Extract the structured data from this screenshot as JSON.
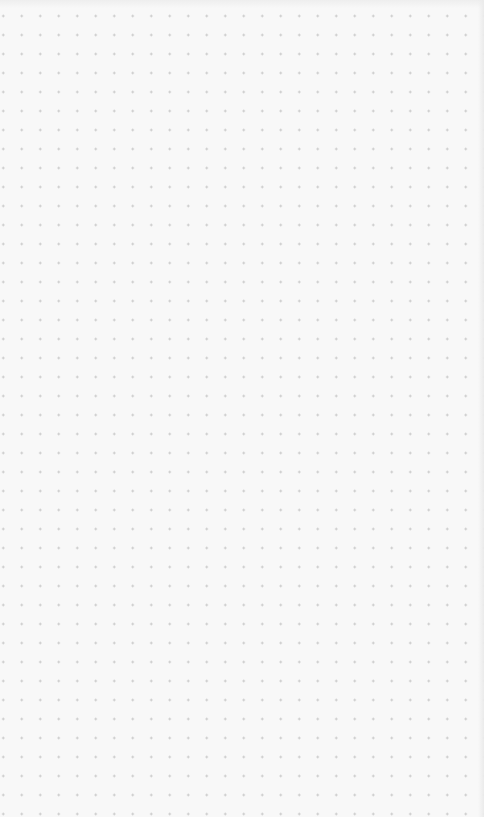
{
  "canvas": {
    "type": "dot-grid",
    "background_color": "#f8f8f8",
    "dot_color": "#c4c4c4",
    "dot_spacing_x": 18.5,
    "dot_spacing_y": 19
  }
}
